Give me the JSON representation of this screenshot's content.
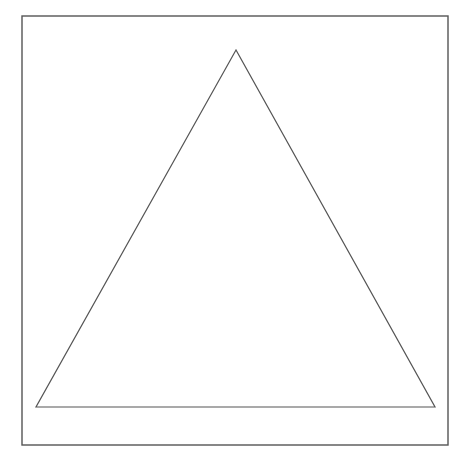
{
  "diagram": {
    "type": "geometric-shape",
    "shape": "equilateral-triangle-in-square-frame",
    "colors": {
      "background": "#ffffff",
      "stroke": "#555555",
      "fill": "none"
    },
    "frame": {
      "x": 22,
      "y": 16,
      "width": 426,
      "height": 429,
      "stroke_width": 1.4
    },
    "triangle": {
      "points": [
        {
          "label": "apex",
          "x": 236,
          "y": 50
        },
        {
          "label": "bottom-left",
          "x": 36,
          "y": 407
        },
        {
          "label": "bottom-right",
          "x": 435,
          "y": 407
        }
      ],
      "stroke_width": 1.2
    }
  }
}
